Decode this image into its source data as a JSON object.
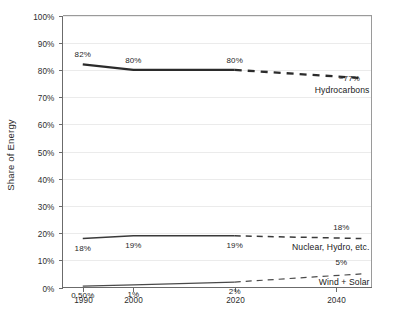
{
  "chart_data": {
    "type": "line",
    "title": "",
    "subtitle": "",
    "xlabel": "",
    "ylabel": "Share of Energy",
    "ylim": [
      0,
      100
    ],
    "xlim": [
      1986,
      2047
    ],
    "grid": true,
    "legend_position": "inline-right-end",
    "y_ticks": [
      "0%",
      "10%",
      "20%",
      "30%",
      "40%",
      "50%",
      "60%",
      "70%",
      "80%",
      "90%",
      "100%"
    ],
    "y_tick_values": [
      0,
      10,
      20,
      30,
      40,
      50,
      60,
      70,
      80,
      90,
      100
    ],
    "x_ticks": [
      "1990",
      "2000",
      "2020",
      "2040"
    ],
    "x_tick_values": [
      1990,
      2000,
      2020,
      2040
    ],
    "series": [
      {
        "name": "Hydrocarbons",
        "color": "#2b2b2b",
        "stroke_width": 2.3,
        "label_text": "Hydrocarbons",
        "projection_label": "~77%",
        "x": [
          1990,
          2000,
          2020,
          2045
        ],
        "values": [
          82,
          80,
          80,
          77
        ],
        "solid_segment": {
          "x": [
            1990,
            2000,
            2020
          ],
          "values": [
            82,
            80,
            80
          ]
        },
        "dashed_segment": {
          "x": [
            2020,
            2045
          ],
          "values": [
            80,
            77
          ]
        },
        "point_labels": [
          {
            "x": 1990,
            "value": 82,
            "text": "82%"
          },
          {
            "x": 2000,
            "value": 80,
            "text": "80%"
          },
          {
            "x": 2020,
            "value": 80,
            "text": "80%"
          }
        ]
      },
      {
        "name": "Nuclear, Hydro, etc.",
        "color": "#3a3a3a",
        "stroke_width": 1.5,
        "label_text": "Nuclear, Hydro, etc.",
        "projection_label": "18%",
        "x": [
          1990,
          2000,
          2020,
          2045
        ],
        "values": [
          18,
          19,
          19,
          18
        ],
        "solid_segment": {
          "x": [
            1990,
            2000,
            2020
          ],
          "values": [
            18,
            19,
            19
          ]
        },
        "dashed_segment": {
          "x": [
            2020,
            2045
          ],
          "values": [
            19,
            18
          ]
        },
        "point_labels": [
          {
            "x": 1990,
            "value": 18,
            "text": "18%"
          },
          {
            "x": 2000,
            "value": 19,
            "text": "19%"
          },
          {
            "x": 2020,
            "value": 19,
            "text": "19%"
          }
        ]
      },
      {
        "name": "Wind + Solar",
        "color": "#4a4a4a",
        "stroke_width": 1.2,
        "label_text": "Wind + Solar",
        "projection_label": "5%",
        "x": [
          1990,
          2000,
          2020,
          2045
        ],
        "values": [
          0.5,
          1,
          2,
          5
        ],
        "solid_segment": {
          "x": [
            1990,
            2000,
            2020
          ],
          "values": [
            0.5,
            1,
            2
          ]
        },
        "dashed_segment": {
          "x": [
            2020,
            2045
          ],
          "values": [
            2,
            5
          ]
        },
        "point_labels": [
          {
            "x": 1990,
            "value": 0.5,
            "text": "0.50%"
          },
          {
            "x": 2000,
            "value": 1,
            "text": "1%"
          },
          {
            "x": 2020,
            "value": 2,
            "text": "2%"
          }
        ]
      }
    ]
  },
  "axis": {
    "y_title": "Share of Energy"
  }
}
